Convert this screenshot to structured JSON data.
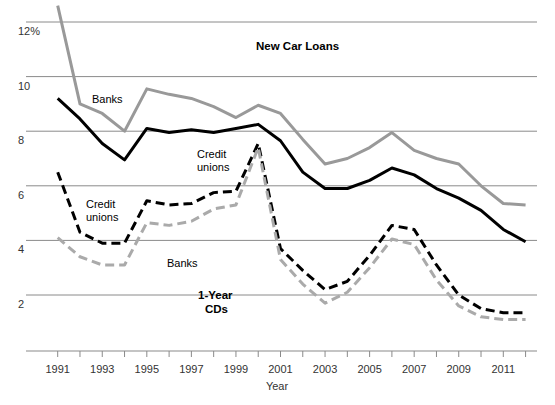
{
  "chart_data": {
    "type": "line",
    "title": "",
    "xlabel": "Year",
    "ylabel": "",
    "ylim": [
      0.6,
      12.6
    ],
    "xlim": [
      1991,
      2012
    ],
    "grid": true,
    "legend_position": "inline-annotations",
    "y_ticks": [
      "12%",
      "10",
      "8",
      "6",
      "4",
      "2"
    ],
    "y_tick_values": [
      12,
      10,
      8,
      6,
      4,
      2
    ],
    "x_ticks": [
      "1991",
      "1993",
      "1995",
      "1997",
      "1999",
      "2001",
      "2003",
      "2005",
      "2007",
      "2009",
      "2011"
    ],
    "x": [
      1991,
      1992,
      1993,
      1994,
      1995,
      1996,
      1997,
      1998,
      1999,
      2000,
      2001,
      2002,
      2003,
      2004,
      2005,
      2006,
      2007,
      2008,
      2009,
      2010,
      2011,
      2012
    ],
    "annotations": [
      {
        "id": "new-car-loans",
        "text": "New Car Loans",
        "x": 256,
        "y": 50,
        "bold": true
      },
      {
        "id": "loans-banks",
        "text": "Banks",
        "x": 92,
        "y": 103,
        "bold": false
      },
      {
        "id": "loans-credit-unions",
        "text": "Credit",
        "x": 197,
        "y": 158,
        "bold": false
      },
      {
        "id": "loans-credit-unions-2",
        "text": "unions",
        "x": 197,
        "y": 171,
        "bold": false
      },
      {
        "id": "cds-credit-unions",
        "text": "Credit",
        "x": 86,
        "y": 208,
        "bold": false
      },
      {
        "id": "cds-credit-unions-2",
        "text": "unions",
        "x": 86,
        "y": 221,
        "bold": false
      },
      {
        "id": "cds-banks",
        "text": "Banks",
        "x": 167,
        "y": 267,
        "bold": false
      },
      {
        "id": "one-year-cds",
        "text": "1-Year",
        "x": 198,
        "y": 299,
        "bold": true
      },
      {
        "id": "one-year-cds-2",
        "text": "CDs",
        "x": 205,
        "y": 313,
        "bold": true
      }
    ],
    "series": [
      {
        "name": "New Car Loans – Banks",
        "group": "New Car Loans",
        "institution": "Banks",
        "color": "#999999",
        "style": "solid",
        "width": 3,
        "values": [
          12.6,
          9.0,
          8.65,
          8.0,
          9.55,
          9.35,
          9.2,
          8.9,
          8.5,
          8.95,
          8.65,
          7.7,
          6.8,
          7.0,
          7.4,
          7.95,
          7.3,
          7.0,
          6.8,
          6.0,
          5.35,
          5.3
        ]
      },
      {
        "name": "New Car Loans – Credit unions",
        "group": "New Car Loans",
        "institution": "Credit unions",
        "color": "#000000",
        "style": "solid",
        "width": 3,
        "values": [
          9.2,
          8.45,
          7.55,
          6.95,
          8.1,
          7.95,
          8.05,
          7.95,
          8.1,
          8.25,
          7.65,
          6.5,
          5.9,
          5.9,
          6.2,
          6.65,
          6.4,
          5.9,
          5.55,
          5.1,
          4.4,
          3.95
        ]
      },
      {
        "name": "1-Year CDs – Credit unions",
        "group": "1-Year CDs",
        "institution": "Credit unions",
        "color": "#000000",
        "style": "dashed",
        "width": 3,
        "values": [
          6.5,
          4.3,
          3.9,
          3.9,
          5.45,
          5.3,
          5.35,
          5.75,
          5.8,
          7.55,
          3.7,
          2.9,
          2.2,
          2.5,
          3.45,
          4.55,
          4.4,
          3.1,
          2.0,
          1.5,
          1.35,
          1.35
        ]
      },
      {
        "name": "1-Year CDs – Banks",
        "group": "1-Year CDs",
        "institution": "Banks",
        "color": "#aaaaaa",
        "style": "dashed",
        "width": 3,
        "values": [
          4.1,
          3.4,
          3.1,
          3.1,
          4.65,
          4.55,
          4.7,
          5.15,
          5.3,
          7.4,
          3.3,
          2.4,
          1.7,
          2.1,
          3.0,
          4.05,
          3.85,
          2.55,
          1.6,
          1.2,
          1.1,
          1.1
        ]
      }
    ]
  }
}
